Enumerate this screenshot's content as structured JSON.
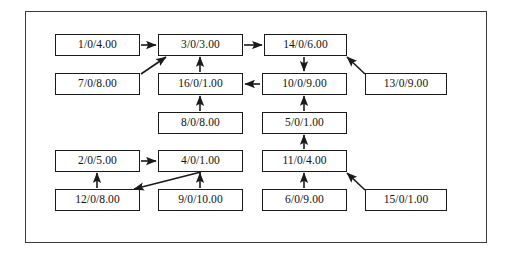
{
  "diagram": {
    "title": "",
    "frame": {
      "x": 25,
      "y": 11,
      "width": 462,
      "height": 232,
      "border_color": "#3a3a3a"
    },
    "background_color": "#ffffff",
    "node_border_color": "#1a1a1a",
    "edge_color": "#1a1a1a",
    "label_format": "id/0/weight",
    "nodes": [
      {
        "key": "n1",
        "label": "1/0/4.00",
        "x": 55,
        "y": 34,
        "w": 85,
        "h": 22
      },
      {
        "key": "n3",
        "label": "3/0/3.00",
        "x": 158,
        "y": 34,
        "w": 85,
        "h": 22
      },
      {
        "key": "n14",
        "label": "14/0/6.00",
        "x": 264,
        "y": 34,
        "w": 83,
        "h": 22
      },
      {
        "key": "n7",
        "label": "7/0/8.00",
        "x": 55,
        "y": 73,
        "w": 85,
        "h": 22
      },
      {
        "key": "n16",
        "label": "16/0/1.00",
        "x": 158,
        "y": 73,
        "w": 85,
        "h": 22
      },
      {
        "key": "n10",
        "label": "10/0/9.00",
        "x": 262,
        "y": 73,
        "w": 85,
        "h": 22
      },
      {
        "key": "n13",
        "label": "13/0/9.00",
        "x": 365,
        "y": 73,
        "w": 82,
        "h": 22
      },
      {
        "key": "n8",
        "label": "8/0/8.00",
        "x": 158,
        "y": 112,
        "w": 85,
        "h": 22
      },
      {
        "key": "n5",
        "label": "5/0/1.00",
        "x": 262,
        "y": 112,
        "w": 85,
        "h": 22
      },
      {
        "key": "n2",
        "label": "2/0/5.00",
        "x": 55,
        "y": 150,
        "w": 85,
        "h": 22
      },
      {
        "key": "n4",
        "label": "4/0/1.00",
        "x": 158,
        "y": 150,
        "w": 85,
        "h": 22
      },
      {
        "key": "n11",
        "label": "11/0/4.00",
        "x": 262,
        "y": 150,
        "w": 85,
        "h": 22
      },
      {
        "key": "n12",
        "label": "12/0/8.00",
        "x": 55,
        "y": 189,
        "w": 85,
        "h": 22
      },
      {
        "key": "n9",
        "label": "9/0/10.00",
        "x": 158,
        "y": 189,
        "w": 85,
        "h": 22
      },
      {
        "key": "n6",
        "label": "6/0/9.00",
        "x": 262,
        "y": 189,
        "w": 85,
        "h": 22
      },
      {
        "key": "n15",
        "label": "15/0/1.00",
        "x": 365,
        "y": 189,
        "w": 82,
        "h": 22
      }
    ],
    "edges": [
      {
        "name": "edge-1-to-3",
        "from": "n1",
        "to": "n3",
        "x1": 141,
        "y1": 45,
        "x2": 156,
        "y2": 45
      },
      {
        "name": "edge-3-to-14",
        "from": "n3",
        "to": "n14",
        "x1": 244,
        "y1": 45,
        "x2": 262,
        "y2": 45
      },
      {
        "name": "edge-7-to-3",
        "from": "n7",
        "to": "n3",
        "x1": 141,
        "y1": 74,
        "x2": 166,
        "y2": 57
      },
      {
        "name": "edge-16-to-3",
        "from": "n16",
        "to": "n3",
        "x1": 200,
        "y1": 72,
        "x2": 200,
        "y2": 57
      },
      {
        "name": "edge-14-to-10",
        "from": "n14",
        "to": "n10",
        "x1": 304,
        "y1": 57,
        "x2": 304,
        "y2": 71
      },
      {
        "name": "edge-13-to-14",
        "from": "n13",
        "to": "n14",
        "x1": 365,
        "y1": 74,
        "x2": 347,
        "y2": 57
      },
      {
        "name": "edge-10-to-16",
        "from": "n10",
        "to": "n16",
        "x1": 260,
        "y1": 84,
        "x2": 245,
        "y2": 84
      },
      {
        "name": "edge-8-to-16",
        "from": "n8",
        "to": "n16",
        "x1": 200,
        "y1": 111,
        "x2": 200,
        "y2": 96
      },
      {
        "name": "edge-5-to-10",
        "from": "n5",
        "to": "n10",
        "x1": 304,
        "y1": 111,
        "x2": 304,
        "y2": 96
      },
      {
        "name": "edge-11-to-5",
        "from": "n11",
        "to": "n5",
        "x1": 304,
        "y1": 149,
        "x2": 304,
        "y2": 135
      },
      {
        "name": "edge-2-to-4",
        "from": "n2",
        "to": "n4",
        "x1": 141,
        "y1": 161,
        "x2": 156,
        "y2": 161
      },
      {
        "name": "edge-12-to-2",
        "from": "n12",
        "to": "n2",
        "x1": 97,
        "y1": 188,
        "x2": 97,
        "y2": 173
      },
      {
        "name": "edge-9-to-4",
        "from": "n9",
        "to": "n4",
        "x1": 200,
        "y1": 188,
        "x2": 200,
        "y2": 173
      },
      {
        "name": "edge-4-to-12",
        "from": "n4",
        "to": "n12",
        "x1": 201,
        "y1": 172,
        "x2": 134,
        "y2": 189
      },
      {
        "name": "edge-6-to-11",
        "from": "n6",
        "to": "n11",
        "x1": 304,
        "y1": 188,
        "x2": 304,
        "y2": 173
      },
      {
        "name": "edge-15-to-11",
        "from": "n15",
        "to": "n11",
        "x1": 365,
        "y1": 190,
        "x2": 347,
        "y2": 173
      }
    ]
  }
}
